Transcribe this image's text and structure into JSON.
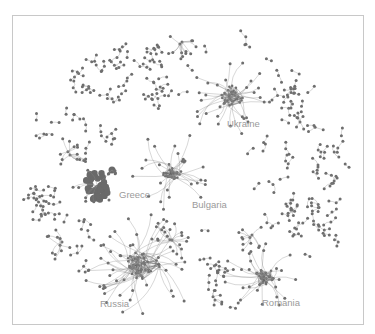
{
  "diagram": {
    "type": "network-graph",
    "frame": {
      "x": 12,
      "y": 15,
      "width": 352,
      "height": 310,
      "border_color": "#c8c8c8"
    },
    "colors": {
      "node": "#6e6e6e",
      "edge": "#8a8a8a",
      "dense_edge": "#555555",
      "label": "#9a9a9a",
      "background": "#ffffff"
    },
    "clusters": [
      {
        "id": "ukraine",
        "label": "Ukraine",
        "cx": 232,
        "cy": 96,
        "core_radius": 13,
        "spokes": 30,
        "spread": 30,
        "label_x": 227,
        "label_y": 127,
        "seed": 11
      },
      {
        "id": "greece",
        "label": "Greece",
        "cx": 97,
        "cy": 186,
        "core_radius": 14,
        "spokes": 6,
        "spread": 18,
        "label_x": 119,
        "label_y": 198,
        "seed": 23,
        "solid_blob": true
      },
      {
        "id": "bulgaria",
        "label": "Bulgaria",
        "cx": 172,
        "cy": 171,
        "core_radius": 10,
        "spokes": 26,
        "spread": 32,
        "label_x": 192,
        "label_y": 208,
        "seed": 37
      },
      {
        "id": "russia",
        "label": "Russia",
        "cx": 143,
        "cy": 265,
        "core_radius": 18,
        "spokes": 48,
        "spread": 40,
        "label_x": 100,
        "label_y": 307,
        "seed": 51
      },
      {
        "id": "romania",
        "label": "Romania",
        "cx": 263,
        "cy": 277,
        "core_radius": 12,
        "spokes": 26,
        "spread": 26,
        "label_x": 262,
        "label_y": 306,
        "seed": 67
      }
    ],
    "sub_clusters": [
      {
        "id": "top-hub",
        "cx": 182,
        "cy": 42,
        "spokes": 12,
        "spread": 16,
        "seed": 5
      },
      {
        "id": "greece-upper",
        "cx": 70,
        "cy": 155,
        "spokes": 14,
        "spread": 18,
        "seed": 9
      },
      {
        "id": "russia-upper",
        "cx": 172,
        "cy": 240,
        "spokes": 16,
        "spread": 22,
        "seed": 13
      },
      {
        "id": "romania-upper",
        "cx": 252,
        "cy": 235,
        "spokes": 10,
        "spread": 18,
        "seed": 17
      },
      {
        "id": "right-star",
        "cx": 300,
        "cy": 122,
        "spokes": 7,
        "spread": 10,
        "seed": 19
      },
      {
        "id": "left-tree",
        "cx": 62,
        "cy": 242,
        "spokes": 10,
        "spread": 16,
        "seed": 29
      },
      {
        "id": "bottom-small",
        "cx": 215,
        "cy": 300,
        "spokes": 6,
        "spread": 8,
        "seed": 31
      }
    ],
    "scatter": {
      "description": "Small disconnected components (pairs, triplets, chains) distributed around the periphery in an elliptical ring",
      "ellipse": {
        "cx": 188,
        "cy": 175,
        "rx": 165,
        "ry": 140
      },
      "inner_ellipse": {
        "rx": 120,
        "ry": 95
      },
      "component_count": 150,
      "seed": 101
    }
  }
}
